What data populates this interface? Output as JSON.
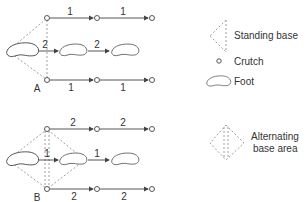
{
  "diagram": {
    "panels": [
      {
        "id": "A",
        "label": "A",
        "top_steps": [
          "1",
          "1"
        ],
        "foot_steps": [
          "2",
          "2"
        ],
        "bottom_steps": [
          "1",
          "1"
        ]
      },
      {
        "id": "B",
        "label": "B",
        "top_steps": [
          "2",
          "2"
        ],
        "foot_steps": [
          "1",
          "1"
        ],
        "bottom_steps": [
          "2",
          "2"
        ]
      }
    ],
    "legend": {
      "standing_base": "Standing base",
      "crutch": "Crutch",
      "foot": "Foot",
      "alternating_line1": "Alternating",
      "alternating_line2": "base area"
    },
    "colors": {
      "line": "#444444",
      "dashed": "#888888"
    }
  }
}
